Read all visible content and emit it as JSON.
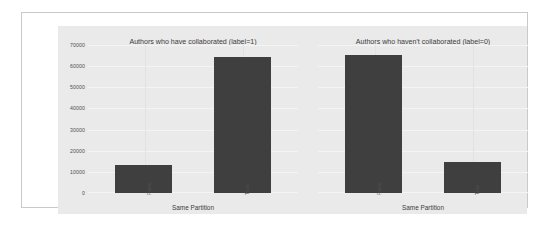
{
  "figure": {
    "background_color": "#ffffff",
    "plot_background_color": "#eaeaea",
    "bar_color": "#3f3f3f",
    "gridline_color": "#f4f4f4",
    "frame_border_color": "#c9c9c9"
  },
  "y_axis": {
    "ticks": [
      "70000",
      "60000",
      "50000",
      "40000",
      "30000",
      "20000",
      "10000",
      "0"
    ]
  },
  "panels": {
    "left": {
      "title": "Authors who have collaborated (label=1)",
      "x_label": "Same Partition",
      "categories": [
        "False",
        "True"
      ],
      "values": [
        13200,
        64300
      ]
    },
    "right": {
      "title": "Authors who haven't collaborated (label=0)",
      "x_label": "Same Partition",
      "categories": [
        "False",
        "True"
      ],
      "values": [
        65200,
        14600
      ]
    }
  },
  "chart_data": [
    {
      "type": "bar",
      "title": "Authors who have collaborated (label=1)",
      "categories": [
        "False",
        "True"
      ],
      "values": [
        13200,
        64300
      ],
      "xlabel": "Same Partition",
      "ylabel": "",
      "ylim": [
        0,
        70000
      ],
      "yticks": [
        0,
        10000,
        20000,
        30000,
        40000,
        50000,
        60000,
        70000
      ],
      "grid": true,
      "legend": "none",
      "bar_color": "#3f3f3f"
    },
    {
      "type": "bar",
      "title": "Authors who haven't collaborated (label=0)",
      "categories": [
        "False",
        "True"
      ],
      "values": [
        65200,
        14600
      ],
      "xlabel": "Same Partition",
      "ylabel": "",
      "ylim": [
        0,
        70000
      ],
      "yticks": [
        0,
        10000,
        20000,
        30000,
        40000,
        50000,
        60000,
        70000
      ],
      "grid": true,
      "legend": "none",
      "bar_color": "#3f3f3f"
    }
  ]
}
